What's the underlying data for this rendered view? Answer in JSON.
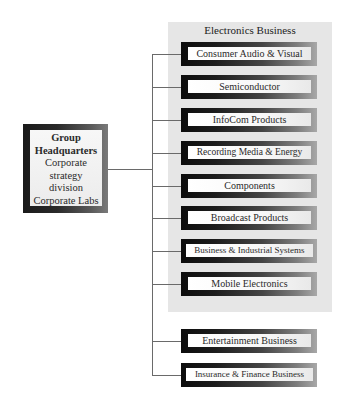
{
  "headquarters": {
    "title_line1": "Group",
    "title_line2": "Headquarters",
    "lines": [
      "Corporate",
      "strategy",
      "division",
      "Corporate Labs"
    ]
  },
  "electronics_group": {
    "title": "Electronics Business",
    "divisions": [
      {
        "label": "Consumer Audio & Visual"
      },
      {
        "label": "Semiconductor"
      },
      {
        "label": "InfoCom Products"
      },
      {
        "label": "Recording Media & Energy"
      },
      {
        "label": "Components"
      },
      {
        "label": "Broadcast Products"
      },
      {
        "label": "Business & Industrial Systems"
      },
      {
        "label": "Mobile Electronics"
      }
    ]
  },
  "other_businesses": [
    {
      "label": "Entertainment Business"
    },
    {
      "label": "Insurance & Finance Business"
    }
  ],
  "colors": {
    "panel_background": "#e6e6e6",
    "connector_line": "#6a6a6a",
    "box_frame_dark": "#0c0c0c",
    "box_frame_light": "#a8a8a8"
  }
}
